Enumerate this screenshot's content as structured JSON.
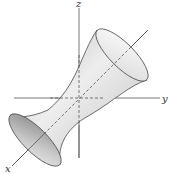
{
  "diagram": {
    "axes": {
      "x_label": "x",
      "y_label": "y",
      "z_label": "z"
    },
    "colors": {
      "axis": "#555555",
      "outline": "#4a4a4a",
      "surface_light": "#f2f2f2",
      "surface_dark": "#9a9a9a"
    }
  }
}
